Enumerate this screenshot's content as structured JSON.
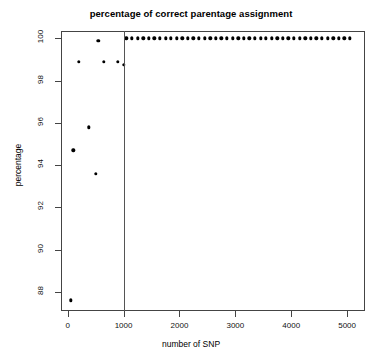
{
  "chart_data": {
    "type": "scatter",
    "title": "percentage of correct parentage assignment",
    "xlabel": "number of SNP",
    "ylabel": "percentage",
    "xlim": [
      -120,
      5320
    ],
    "ylim": [
      87.1,
      100.35
    ],
    "xticks": [
      0,
      1000,
      2000,
      3000,
      4000,
      5000
    ],
    "xtick_labels": [
      "0",
      "1000",
      "2000",
      "3000",
      "4000",
      "5000"
    ],
    "yticks": [
      88,
      90,
      92,
      94,
      96,
      98,
      100
    ],
    "ytick_labels": [
      "88",
      "90",
      "92",
      "94",
      "96",
      "98",
      "100"
    ],
    "grid": false,
    "legend": false,
    "marker": "filled-circle",
    "marker_color": "#000000",
    "reference_line": {
      "orientation": "vertical",
      "x": 1000,
      "color": "#555555"
    },
    "series": [
      {
        "name": "percentage of correct parentage assignment",
        "points": [
          [
            50,
            87.6
          ],
          [
            100,
            94.7
          ],
          [
            200,
            98.9
          ],
          [
            375,
            95.8
          ],
          [
            500,
            93.6
          ],
          [
            550,
            99.9
          ],
          [
            650,
            98.9
          ],
          [
            900,
            98.9
          ],
          [
            1000,
            98.75
          ],
          [
            1050,
            100
          ],
          [
            1150,
            100
          ],
          [
            1250,
            100
          ],
          [
            1350,
            100
          ],
          [
            1450,
            100
          ],
          [
            1550,
            100
          ],
          [
            1650,
            100
          ],
          [
            1750,
            100
          ],
          [
            1850,
            100
          ],
          [
            1950,
            100
          ],
          [
            2050,
            100
          ],
          [
            2150,
            100
          ],
          [
            2250,
            100
          ],
          [
            2350,
            100
          ],
          [
            2450,
            100
          ],
          [
            2550,
            100
          ],
          [
            2650,
            100
          ],
          [
            2750,
            100
          ],
          [
            2850,
            100
          ],
          [
            2950,
            100
          ],
          [
            3050,
            100
          ],
          [
            3150,
            100
          ],
          [
            3250,
            100
          ],
          [
            3350,
            100
          ],
          [
            3450,
            100
          ],
          [
            3550,
            100
          ],
          [
            3650,
            100
          ],
          [
            3750,
            100
          ],
          [
            3850,
            100
          ],
          [
            3950,
            100
          ],
          [
            4050,
            100
          ],
          [
            4150,
            100
          ],
          [
            4250,
            100
          ],
          [
            4350,
            100
          ],
          [
            4450,
            100
          ],
          [
            4550,
            100
          ],
          [
            4650,
            100
          ],
          [
            4750,
            100
          ],
          [
            4850,
            100
          ],
          [
            4950,
            100
          ],
          [
            5050,
            100
          ]
        ]
      }
    ]
  }
}
